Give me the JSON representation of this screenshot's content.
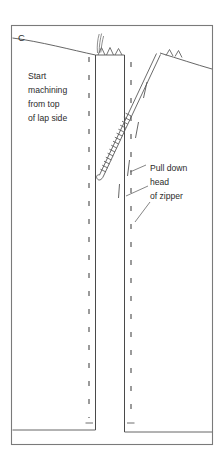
{
  "figure": {
    "panel_label": "C",
    "annotations": [
      {
        "id": "start-machining",
        "lines": [
          "Start",
          "machining",
          "from top",
          "of lap side"
        ]
      },
      {
        "id": "pull-down-zipper",
        "lines": [
          "Pull down",
          "head",
          "of zipper"
        ]
      }
    ],
    "colors": {
      "background": "#ffffff",
      "ink": "#2b2b2b",
      "line": "#555555",
      "frame": "#7a7a7a"
    },
    "icons": {
      "zipper_teeth": "zipper-teeth-icon",
      "zipper_tape": "zipper-tape-icon",
      "thread_tails": "thread-tails-icon",
      "slider_head": "zipper-slider-icon"
    }
  }
}
